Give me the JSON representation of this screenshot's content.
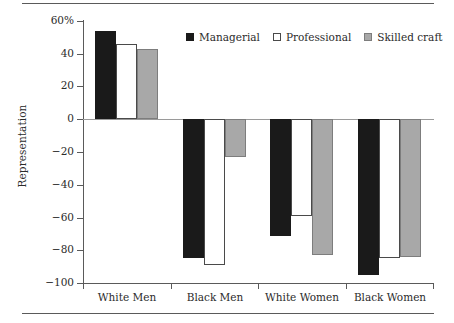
{
  "chart_data": {
    "type": "bar",
    "title": "",
    "xlabel": "",
    "ylabel": "Representation",
    "ylim": [
      -100,
      60
    ],
    "yticks": [
      60,
      40,
      20,
      0,
      -20,
      -40,
      -60,
      -80,
      -100
    ],
    "ytick_labels": [
      "60%",
      "40",
      "20",
      "0",
      "−20",
      "−40",
      "−60",
      "−80",
      "−100"
    ],
    "categories": [
      "White Men",
      "Black Men",
      "White Women",
      "Black Women"
    ],
    "grid": false,
    "legend_position": "top-right",
    "series": [
      {
        "name": "Managerial",
        "color": "#1a1a1a",
        "values": [
          54,
          -85,
          -71,
          -95
        ]
      },
      {
        "name": "Professional",
        "color": "#ffffff",
        "values": [
          46,
          -89,
          -59,
          -85
        ]
      },
      {
        "name": "Skilled craft",
        "color": "#a8a8a8",
        "values": [
          43,
          -23,
          -83,
          -84
        ]
      }
    ]
  },
  "legend": {
    "items": [
      {
        "label": "Managerial",
        "swatch": "black-square-icon"
      },
      {
        "label": "Professional",
        "swatch": "white-square-icon"
      },
      {
        "label": "Skilled craft",
        "swatch": "gray-square-icon"
      }
    ]
  },
  "axis": {
    "y_title": "Representation",
    "y_tick_labels": [
      "60%",
      "40",
      "20",
      "0",
      "−20",
      "−40",
      "−60",
      "−80",
      "−100"
    ],
    "x_tick_labels": [
      "White Men",
      "Black Men",
      "White Women",
      "Black Women"
    ]
  },
  "colors": {
    "managerial": "#1a1a1a",
    "professional": "#ffffff",
    "skilled_craft": "#a8a8a8",
    "axis": "#5a5a5a",
    "zero_line": "#9a9a9a",
    "text": "#2b2b2b"
  }
}
